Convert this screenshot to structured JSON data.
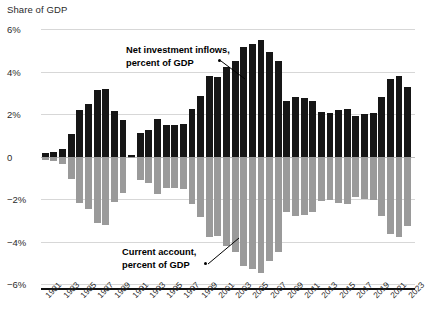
{
  "chart_data": {
    "type": "bar",
    "title": "Share of GDP",
    "xlabel": "",
    "ylabel": "Share of GDP",
    "ylim": [
      -6,
      6
    ],
    "yticks": [
      6,
      4,
      2,
      0,
      -2,
      -4,
      -6
    ],
    "ytick_labels": [
      "6%",
      "4%",
      "2%",
      "0",
      "−2%",
      "−4%",
      "−6%"
    ],
    "grid": true,
    "legend_position": "annotations-inline",
    "x": [
      1981,
      1982,
      1983,
      1984,
      1985,
      1986,
      1987,
      1988,
      1989,
      1990,
      1991,
      1992,
      1993,
      1994,
      1995,
      1996,
      1997,
      1998,
      1999,
      2000,
      2001,
      2002,
      2003,
      2004,
      2005,
      2006,
      2007,
      2008,
      2009,
      2010,
      2011,
      2012,
      2013,
      2014,
      2015,
      2016,
      2017,
      2018,
      2019,
      2020,
      2021,
      2022,
      2023
    ],
    "xtick_labels": [
      "1981",
      "1983",
      "1985",
      "1987",
      "1989",
      "1991",
      "1993",
      "1995",
      "1997",
      "1999",
      "2001",
      "2003",
      "2005",
      "2007",
      "2009",
      "2011",
      "2013",
      "2015",
      "2017",
      "2019",
      "2021",
      "2023"
    ],
    "series": [
      {
        "name": "Net investment inflows, percent of GDP",
        "color": "#161616",
        "values": [
          0.15,
          0.2,
          0.35,
          1.05,
          2.2,
          2.45,
          3.15,
          3.2,
          2.15,
          1.7,
          0.05,
          1.1,
          1.25,
          1.75,
          1.5,
          1.5,
          1.55,
          2.25,
          2.85,
          3.8,
          3.75,
          4.2,
          4.5,
          5.15,
          5.3,
          5.5,
          4.9,
          4.5,
          2.6,
          2.8,
          2.75,
          2.6,
          2.1,
          2.05,
          2.2,
          2.25,
          1.9,
          2.0,
          2.05,
          2.8,
          3.65,
          3.8,
          3.25
        ]
      },
      {
        "name": "Current account, percent of GDP",
        "color": "#9a9a9a",
        "values": [
          -0.15,
          -0.2,
          -0.35,
          -1.05,
          -2.2,
          -2.45,
          -3.15,
          -3.2,
          -2.15,
          -1.7,
          -0.05,
          -1.1,
          -1.25,
          -1.75,
          -1.5,
          -1.5,
          -1.55,
          -2.25,
          -2.85,
          -3.8,
          -3.75,
          -4.2,
          -4.5,
          -5.15,
          -5.3,
          -5.5,
          -4.9,
          -4.5,
          -2.6,
          -2.8,
          -2.75,
          -2.6,
          -2.1,
          -2.05,
          -2.2,
          -2.25,
          -1.9,
          -2.0,
          -2.05,
          -2.8,
          -3.65,
          -3.8,
          -3.25
        ]
      }
    ],
    "annotations": [
      {
        "id": "net",
        "line1": "Net investment inflows,",
        "line2": "percent of GDP"
      },
      {
        "id": "current",
        "line1": "Current account,",
        "line2": "percent of GDP"
      }
    ]
  }
}
